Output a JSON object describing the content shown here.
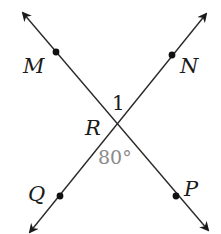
{
  "diagram": {
    "type": "intersecting-lines",
    "intersection": {
      "label": "R",
      "x": 114,
      "y": 124
    },
    "lines": [
      {
        "name": "line-MP",
        "from": {
          "x": 23,
          "y": 13
        },
        "to": {
          "x": 208,
          "y": 230
        },
        "points": [
          "M",
          "R",
          "P"
        ]
      },
      {
        "name": "line-NQ",
        "from": {
          "x": 206,
          "y": 14
        },
        "to": {
          "x": 30,
          "y": 232
        },
        "points": [
          "N",
          "R",
          "Q"
        ]
      }
    ],
    "points": [
      {
        "label": "M",
        "x": 56,
        "y": 52
      },
      {
        "label": "N",
        "x": 172,
        "y": 55
      },
      {
        "label": "Q",
        "x": 60,
        "y": 196
      },
      {
        "label": "P",
        "x": 176,
        "y": 196
      }
    ],
    "labels": {
      "M": "M",
      "N": "N",
      "Q": "Q",
      "P": "P",
      "R": "R",
      "angle1": "1",
      "angle_value": "80°"
    },
    "colors": {
      "line": "#2a2a2a",
      "text": "#1a1a1a",
      "angle_text": "#8a8a8a",
      "background": "#ffffff"
    }
  }
}
